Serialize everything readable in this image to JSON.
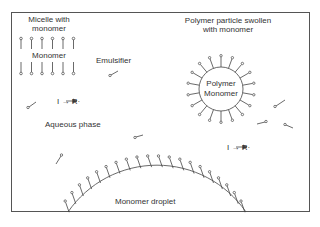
{
  "diagram": {
    "type": "emulsion-polymerization-schematic",
    "labels": {
      "micelle_line1": "Micelle with",
      "micelle_line2": "monomer",
      "micelle_inner": "Monomer",
      "emulsifier": "Emulsifier",
      "particle_line1": "Polymer particle swollen",
      "particle_line2": "with monomer",
      "particle_inner1": "Polymer",
      "particle_inner2": "Monomer",
      "aqueous": "Aqueous phase",
      "droplet": "Monomer droplet",
      "initiator_left": "I → R·",
      "initiator_right": "I → R·"
    },
    "colors": {
      "line": "#444444",
      "text": "#333333",
      "background": "#ffffff"
    }
  }
}
